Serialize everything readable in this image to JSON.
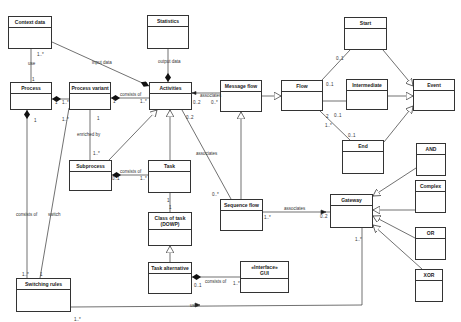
{
  "diagram": {
    "type": "uml-class-diagram",
    "classes": [
      {
        "id": "context",
        "name": "Context data",
        "x": 8,
        "y": 16,
        "w": 44,
        "h": 33
      },
      {
        "id": "statistics",
        "name": "Statistics",
        "x": 147,
        "y": 15,
        "w": 42,
        "h": 34
      },
      {
        "id": "start",
        "name": "Start",
        "x": 344,
        "y": 17,
        "w": 43,
        "h": 33
      },
      {
        "id": "process",
        "name": "Process",
        "x": 10,
        "y": 82,
        "w": 42,
        "h": 28
      },
      {
        "id": "variant",
        "name": "Process variant",
        "x": 69,
        "y": 82,
        "w": 42,
        "h": 28
      },
      {
        "id": "activities",
        "name": "Activities",
        "x": 149,
        "y": 82,
        "w": 43,
        "h": 28
      },
      {
        "id": "msgflow",
        "name": "Message flow",
        "x": 220,
        "y": 80,
        "w": 42,
        "h": 32
      },
      {
        "id": "flow",
        "name": "Flow",
        "x": 281,
        "y": 80,
        "w": 42,
        "h": 31
      },
      {
        "id": "intermediate",
        "name": "Intermediate",
        "x": 346,
        "y": 79,
        "w": 42,
        "h": 31
      },
      {
        "id": "event",
        "name": "Event",
        "x": 413,
        "y": 79,
        "w": 42,
        "h": 32
      },
      {
        "id": "subprocess",
        "name": "Subprocess",
        "x": 69,
        "y": 160,
        "w": 43,
        "h": 31
      },
      {
        "id": "task",
        "name": "Task",
        "x": 148,
        "y": 160,
        "w": 43,
        "h": 33
      },
      {
        "id": "end",
        "name": "End",
        "x": 342,
        "y": 140,
        "w": 42,
        "h": 34
      },
      {
        "id": "and",
        "name": "AND",
        "x": 416,
        "y": 143,
        "w": 30,
        "h": 33
      },
      {
        "id": "seqflow",
        "name": "Sequence flow",
        "x": 220,
        "y": 199,
        "w": 43,
        "h": 32
      },
      {
        "id": "gateway",
        "name": "Gateway",
        "x": 330,
        "y": 194,
        "w": 43,
        "h": 34
      },
      {
        "id": "complex",
        "name": "Complex",
        "x": 415,
        "y": 180,
        "w": 31,
        "h": 33
      },
      {
        "id": "classoftask",
        "name": "Class of task\n(DOWP)",
        "x": 148,
        "y": 212,
        "w": 44,
        "h": 34
      },
      {
        "id": "taskalt",
        "name": "Task alternative",
        "x": 148,
        "y": 262,
        "w": 44,
        "h": 32
      },
      {
        "id": "gui",
        "name": "«Interface»\nGUI",
        "x": 240,
        "y": 261,
        "w": 49,
        "h": 32
      },
      {
        "id": "or",
        "name": "OR",
        "x": 415,
        "y": 227,
        "w": 31,
        "h": 33
      },
      {
        "id": "switching",
        "name": "Switching rules",
        "x": 16,
        "y": 278,
        "w": 55,
        "h": 34
      },
      {
        "id": "xor",
        "name": "XOR",
        "x": 415,
        "y": 269,
        "w": 28,
        "h": 33
      }
    ],
    "edges": [
      {
        "from": "context",
        "to": "process",
        "kind": "association",
        "label": "use",
        "mult_from": "1..*",
        "mult_to": "1"
      },
      {
        "from": "context",
        "to": "activities",
        "kind": "composition-at-target",
        "label": "input data"
      },
      {
        "from": "statistics",
        "to": "activities",
        "kind": "composition-at-target",
        "label": "output data"
      },
      {
        "from": "variant",
        "to": "process",
        "kind": "composition-at-target",
        "mult_from": "1..*",
        "mult_to": "1"
      },
      {
        "from": "activities",
        "to": "variant",
        "kind": "composition-at-target",
        "label": "consists of",
        "mult_from": "1..*",
        "mult_to": "1"
      },
      {
        "from": "msgflow",
        "to": "activities",
        "kind": "association",
        "label": "associates",
        "mult_from": "0..*",
        "mult_to": "0..2"
      },
      {
        "from": "msgflow",
        "to": "flow",
        "kind": "generalization"
      },
      {
        "from": "seqflow",
        "to": "msgflow",
        "kind": "generalization"
      },
      {
        "from": "seqflow",
        "to": "activities",
        "kind": "association",
        "label": "associates",
        "mult_from": "0..*",
        "mult_to": "0..2"
      },
      {
        "from": "subprocess",
        "to": "variant",
        "kind": "association",
        "label": "enriched by",
        "mult_from": "1..*",
        "mult_to": "1"
      },
      {
        "from": "subprocess",
        "to": "activities",
        "kind": "generalization"
      },
      {
        "from": "task",
        "to": "activities",
        "kind": "generalization"
      },
      {
        "from": "task",
        "to": "subprocess",
        "kind": "composition-at-target",
        "label": "consists of",
        "mult_from": "1..*",
        "mult_to": "0..1"
      },
      {
        "from": "task",
        "to": "classoftask",
        "kind": "association",
        "mult_from": "1",
        "mult_to": "1"
      },
      {
        "from": "taskalt",
        "to": "classoftask",
        "kind": "generalization"
      },
      {
        "from": "gui",
        "to": "taskalt",
        "kind": "composition-at-target",
        "label": "consists of",
        "mult_from": "1..*",
        "mult_to": "0..1"
      },
      {
        "from": "flow",
        "to": "start",
        "kind": "association",
        "mult_from": "1..*",
        "mult_to": "0..1"
      },
      {
        "from": "flow",
        "to": "intermediate",
        "kind": "association",
        "mult_from": "2",
        "mult_to": "0..1"
      },
      {
        "from": "flow",
        "to": "end",
        "kind": "association",
        "mult_from": "1..*",
        "mult_to": "0..1"
      },
      {
        "from": "start",
        "to": "event",
        "kind": "generalization"
      },
      {
        "from": "intermediate",
        "to": "event",
        "kind": "generalization"
      },
      {
        "from": "end",
        "to": "event",
        "kind": "generalization"
      },
      {
        "from": "seqflow",
        "to": "gateway",
        "kind": "association",
        "label": "associates",
        "mult_from": "1..*",
        "mult_to": "0..2"
      },
      {
        "from": "and",
        "to": "gateway",
        "kind": "generalization"
      },
      {
        "from": "complex",
        "to": "gateway",
        "kind": "generalization"
      },
      {
        "from": "or",
        "to": "gateway",
        "kind": "generalization"
      },
      {
        "from": "xor",
        "to": "gateway",
        "kind": "generalization"
      },
      {
        "from": "switching",
        "to": "process",
        "kind": "composition-at-target",
        "label": "consists of",
        "mult_from": "1..*",
        "mult_to": "1"
      },
      {
        "from": "switching",
        "to": "variant",
        "kind": "association",
        "label": "switch",
        "mult_from": "1",
        "mult_to": "1..*"
      },
      {
        "from": "switching",
        "to": "gateway",
        "kind": "association",
        "label": "use",
        "mult_from": "1..*",
        "mult_to": "1..*"
      }
    ],
    "labels": [
      {
        "text": "use",
        "x": 28,
        "y": 61
      },
      {
        "text": "1..*",
        "x": 37,
        "y": 52
      },
      {
        "text": "1",
        "x": 32,
        "y": 77
      },
      {
        "text": "input data",
        "x": 92,
        "y": 60
      },
      {
        "text": "output data",
        "x": 158,
        "y": 59
      },
      {
        "text": "consists of",
        "x": 120,
        "y": 92
      },
      {
        "text": "1",
        "x": 113,
        "y": 99
      },
      {
        "text": "1..*",
        "x": 140,
        "y": 99
      },
      {
        "text": "1",
        "x": 55,
        "y": 100
      },
      {
        "text": "1..*",
        "x": 62,
        "y": 100
      },
      {
        "text": "1..*",
        "x": 62,
        "y": 117
      },
      {
        "text": "1",
        "x": 34,
        "y": 118
      },
      {
        "text": "associates",
        "x": 200,
        "y": 93
      },
      {
        "text": "0..2",
        "x": 193,
        "y": 100
      },
      {
        "text": "0..*",
        "x": 211,
        "y": 100
      },
      {
        "text": "0..2",
        "x": 186,
        "y": 115
      },
      {
        "text": "enriched by",
        "x": 77,
        "y": 132
      },
      {
        "text": "1",
        "x": 97,
        "y": 116
      },
      {
        "text": "1..*",
        "x": 93,
        "y": 151
      },
      {
        "text": "consists of",
        "x": 120,
        "y": 169
      },
      {
        "text": "0..1",
        "x": 112,
        "y": 176
      },
      {
        "text": "1..*",
        "x": 140,
        "y": 176
      },
      {
        "text": "associates",
        "x": 196,
        "y": 151
      },
      {
        "text": "0..*",
        "x": 212,
        "y": 192
      },
      {
        "text": "1",
        "x": 167,
        "y": 198
      },
      {
        "text": "1",
        "x": 169,
        "y": 205
      },
      {
        "text": "consists of",
        "x": 16,
        "y": 212
      },
      {
        "text": "switch",
        "x": 48,
        "y": 212
      },
      {
        "text": "1..*",
        "x": 22,
        "y": 272
      },
      {
        "text": "1",
        "x": 40,
        "y": 272
      },
      {
        "text": "associates",
        "x": 284,
        "y": 206
      },
      {
        "text": "1..*",
        "x": 264,
        "y": 215
      },
      {
        "text": "0..2",
        "x": 320,
        "y": 214
      },
      {
        "text": "0..1",
        "x": 336,
        "y": 56
      },
      {
        "text": "0..1",
        "x": 326,
        "y": 82
      },
      {
        "text": "2",
        "x": 326,
        "y": 114
      },
      {
        "text": "0..1",
        "x": 334,
        "y": 113
      },
      {
        "text": "1..*",
        "x": 325,
        "y": 123
      },
      {
        "text": "0..1",
        "x": 348,
        "y": 133
      },
      {
        "text": "1..*",
        "x": 355,
        "y": 237
      },
      {
        "text": "consists of",
        "x": 205,
        "y": 279
      },
      {
        "text": "0..1",
        "x": 194,
        "y": 283
      },
      {
        "text": "1..*",
        "x": 233,
        "y": 281
      },
      {
        "text": "use",
        "x": 190,
        "y": 303
      },
      {
        "text": "1..*",
        "x": 74,
        "y": 317
      }
    ]
  }
}
